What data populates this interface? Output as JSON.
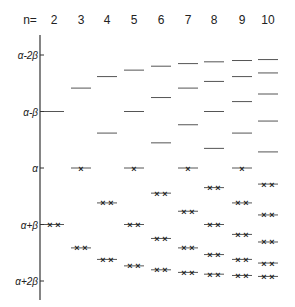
{
  "diagram": {
    "title_label": "n=",
    "axis": {
      "ticks": [
        {
          "label": "α-2β",
          "multiple": -2
        },
        {
          "label": "α-β",
          "multiple": -1
        },
        {
          "label": "α",
          "multiple": 0
        },
        {
          "label": "α+β",
          "multiple": 1
        },
        {
          "label": "α+2β",
          "multiple": 2
        }
      ]
    },
    "columns": [
      {
        "n": "2",
        "x": 54
      },
      {
        "n": "3",
        "x": 81
      },
      {
        "n": "4",
        "x": 107
      },
      {
        "n": "5",
        "x": 134
      },
      {
        "n": "6",
        "x": 161
      },
      {
        "n": "7",
        "x": 188
      },
      {
        "n": "8",
        "x": 214
      },
      {
        "n": "9",
        "x": 242
      },
      {
        "n": "10",
        "x": 268
      }
    ]
  }
}
